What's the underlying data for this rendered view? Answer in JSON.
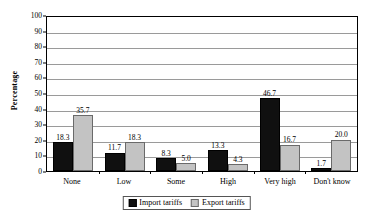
{
  "chart_data": {
    "type": "bar",
    "title": "",
    "xlabel": "",
    "ylabel": "Percentage",
    "ylim": [
      0,
      100
    ],
    "ytick_step": 10,
    "yticks": [
      0,
      10,
      20,
      30,
      40,
      50,
      60,
      70,
      80,
      90,
      100
    ],
    "grid": true,
    "legend_position": "bottom-center",
    "categories": [
      "None",
      "Low",
      "Some",
      "High",
      "Very high",
      "Don't know"
    ],
    "series": [
      {
        "name": "Import tariffs",
        "color": "#101010",
        "values": [
          18.3,
          11.7,
          8.3,
          13.3,
          46.7,
          1.7
        ],
        "labels": [
          "18.3",
          "11.7",
          "8.3",
          "13.3",
          "46.7",
          "1.7"
        ]
      },
      {
        "name": "Export tariffs",
        "color": "#c3c3c3",
        "values": [
          35.7,
          18.3,
          5.0,
          4.3,
          16.7,
          20.0
        ],
        "labels": [
          "35.7",
          "18.3",
          "5.0",
          "4.3",
          "16.7",
          "20.0"
        ]
      }
    ]
  },
  "axis": {
    "y_title": "Percentage",
    "y_tick_labels": [
      "100",
      "90",
      "80",
      "70",
      "60",
      "50",
      "40",
      "30",
      "20",
      "10",
      "0"
    ],
    "x_tick_labels": [
      "None",
      "Low",
      "Some",
      "High",
      "Very high",
      "Don't know"
    ]
  },
  "legend": {
    "items": [
      {
        "label": "Import tariffs",
        "swatch": "import-tariffs-swatch"
      },
      {
        "label": "Export tariffs",
        "swatch": "export-tariffs-swatch"
      }
    ]
  }
}
